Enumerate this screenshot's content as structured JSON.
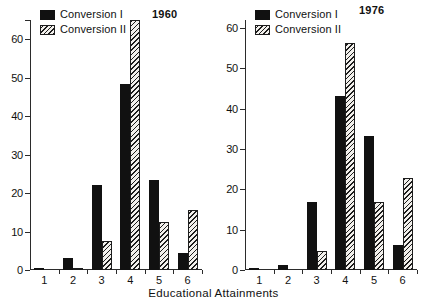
{
  "figure": {
    "xtitle": "Educational Attainments",
    "legend": {
      "series1_label": "Conversion I",
      "series2_label": "Conversion II"
    },
    "colors": {
      "series1": "#111111",
      "series2_line": "#1d1d1d",
      "series2_fill": "#f2f0ec",
      "axis": "#2b2b2b",
      "background": "#ffffff"
    }
  },
  "panels": [
    {
      "id": "panel-1960",
      "year": "1960",
      "ytick_labels": [
        "0",
        "10",
        "20",
        "30",
        "40",
        "50",
        "60"
      ]
    },
    {
      "id": "panel-1976",
      "year": "1976",
      "ytick_labels": [
        "0",
        "10",
        "20",
        "30",
        "40",
        "50",
        "60"
      ]
    }
  ],
  "chart_data": [
    {
      "type": "bar",
      "title": "1960",
      "xlabel": "Educational Attainments",
      "ylabel": "",
      "categories": [
        "1",
        "2",
        "3",
        "4",
        "5",
        "6"
      ],
      "yticks": [
        0,
        10,
        20,
        30,
        40,
        50,
        60
      ],
      "ylim": [
        0,
        65
      ],
      "grid": false,
      "legend_position": "top-left",
      "series": [
        {
          "name": "Conversion I",
          "values": [
            0.3,
            3.2,
            22.2,
            48.4,
            23.4,
            4.5
          ]
        },
        {
          "name": "Conversion II",
          "values": [
            0.0,
            0.6,
            7.6,
            65.0,
            12.4,
            15.6
          ]
        }
      ]
    },
    {
      "type": "bar",
      "title": "1976",
      "xlabel": "Educational Attainments",
      "ylabel": "",
      "categories": [
        "1",
        "2",
        "3",
        "4",
        "5",
        "6"
      ],
      "yticks": [
        0,
        10,
        20,
        30,
        40,
        50,
        60
      ],
      "ylim": [
        0,
        62
      ],
      "grid": false,
      "legend_position": "top-left",
      "series": [
        {
          "name": "Conversion I",
          "values": [
            0.2,
            1.3,
            16.8,
            43.2,
            33.3,
            6.3
          ]
        },
        {
          "name": "Conversion II",
          "values": [
            0.0,
            0.0,
            4.8,
            56.2,
            16.8,
            22.8
          ]
        }
      ]
    }
  ]
}
